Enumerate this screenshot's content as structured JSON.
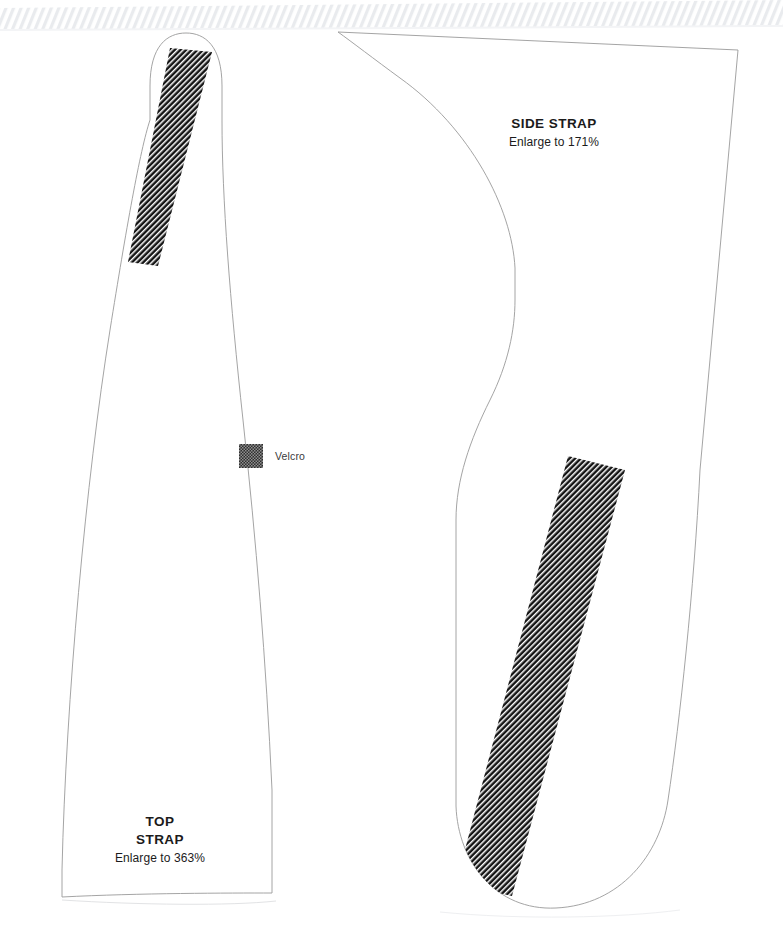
{
  "sheet": {
    "width": 783,
    "height": 927,
    "background_color": "#ffffff",
    "description": "Sewing pattern sheet with two strap pieces"
  },
  "top_edge": {
    "name": "cut-edge-hatching",
    "style": "diagonal hatch band",
    "color": "#eceef0"
  },
  "pieces": [
    {
      "id": "top-strap",
      "title": "TOP",
      "title_line2": "STRAP",
      "subtitle": "Enlarge to 363%",
      "outline_color": "#9a9a9a",
      "fill_color": "#ffffff"
    },
    {
      "id": "side-strap",
      "title": "SIDE STRAP",
      "subtitle": "Enlarge to 171%",
      "outline_color": "#9a9a9a",
      "fill_color": "#ffffff"
    }
  ],
  "legend": {
    "swatch_name": "velcro-swatch",
    "label": "Velcro",
    "swatch_color": "#2e2e2e",
    "swatch_pattern": "checker-hatch"
  },
  "velcro_patches": [
    {
      "id": "velcro-patch-top-strap",
      "pattern": "diagonal-hatch",
      "color": "#2b2b2b"
    },
    {
      "id": "velcro-patch-side-strap",
      "pattern": "diagonal-hatch",
      "color": "#1a1a1a"
    }
  ]
}
